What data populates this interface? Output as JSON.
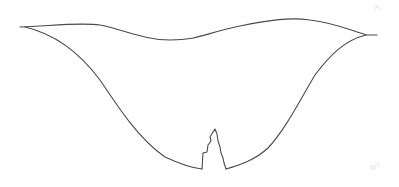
{
  "drawing": {
    "description": "hand-drawn bowl shape outline with spike at bottom",
    "stroke_color": "#4a4a4a",
    "background": "#ffffff",
    "shape": {
      "top_edge": "M20,27 C50,26 80,22 100,25 C125,30 145,40 170,40 C200,40 205,33 240,26 C270,20 290,17 310,20 C335,23 350,30 367,35 L377,35",
      "outer_left": "M25,27 C60,35 85,60 100,80 C120,110 140,140 165,157 C180,164 192,168 202,169",
      "spike": "M202,169 L203,153 L207,152 L208,145 L211,141 L210,137 L213,132 L215,129 L217,134 L218,141 L220,147 L221,153 L223,158 L224,163 L226,169",
      "outer_right": "M226,169 C240,165 255,160 268,148 C285,130 300,100 315,75 C330,55 345,40 366,35"
    }
  },
  "marks": {
    "top_right": "A",
    "bottom_right": "ᴍᵀ"
  }
}
